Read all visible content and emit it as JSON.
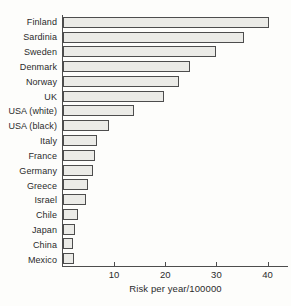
{
  "figure": {
    "background": "#fdfdfb",
    "bar_fill": "#ebebe7",
    "bar_border": "#4d4d4d",
    "axis_color": "#4d4d4d",
    "text_color": "#2b2b2b"
  },
  "chart_data": {
    "type": "bar",
    "orientation": "horizontal",
    "title": "",
    "categories": [
      "Finland",
      "Sardinia",
      "Sweden",
      "Denmark",
      "Norway",
      "UK",
      "USA (white)",
      "USA (black)",
      "Italy",
      "France",
      "Germany",
      "Greece",
      "Israel",
      "Chile",
      "Japan",
      "China",
      "Mexico"
    ],
    "values": [
      39.8,
      35,
      29.5,
      24.5,
      22.2,
      19.3,
      13.5,
      8.6,
      6.3,
      5.9,
      5.5,
      4.4,
      4.2,
      2.6,
      2.0,
      1.6,
      1.7
    ],
    "xlabel": "Risk per year/100000",
    "ylabel": "",
    "xticks": [
      10,
      20,
      30,
      40
    ],
    "xlim": [
      0,
      44
    ],
    "grid": false,
    "legend": null
  }
}
